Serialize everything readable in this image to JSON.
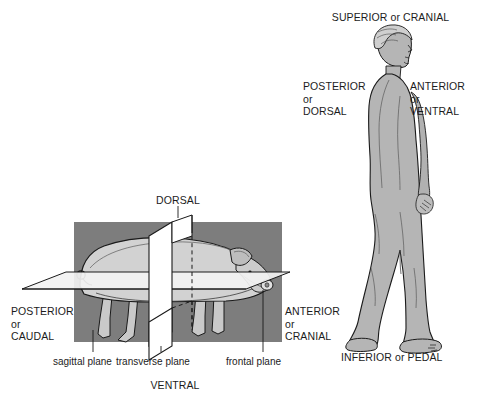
{
  "figure": {
    "title_alt": "Anatomical directional terms and body planes",
    "background_color": "#ffffff",
    "colors": {
      "box_fill": "#7d7d7d",
      "pig_fill": "#d2d2d2",
      "plane_fill": "#ffffff",
      "frontal_plane_fill": "#efefef",
      "human_fill": "#b5b5b5",
      "outline": "#1a1a1a",
      "text": "#1c1c1c"
    }
  },
  "human_panel": {
    "superior_label": "SUPERIOR or CRANIAL",
    "posterior_label": "POSTERIOR\nor\nDORSAL",
    "anterior_label": "ANTERIOR\nor\nVENTRAL",
    "inferior_label": "INFERIOR or PEDAL"
  },
  "pig_panel": {
    "dorsal_label": "DORSAL",
    "ventral_label": "VENTRAL",
    "posterior_label": "POSTERIOR\nor\nCAUDAL",
    "anterior_label": "ANTERIOR\nor\nCRANIAL",
    "planes": [
      {
        "name": "sagittal-plane",
        "label": "sagittal plane"
      },
      {
        "name": "transverse-plane",
        "label": "transverse plane"
      },
      {
        "name": "frontal-plane",
        "label": "frontal plane"
      }
    ]
  }
}
